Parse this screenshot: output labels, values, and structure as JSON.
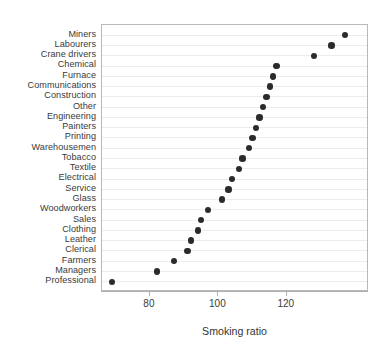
{
  "chart_data": {
    "type": "scatter",
    "plot_style": "cleveland-dot-plot",
    "title": "",
    "xlabel": "Smoking ratio",
    "ylabel": "",
    "xlim": [
      66,
      144
    ],
    "xticks": [
      80,
      100,
      120
    ],
    "xtick_labels": [
      "80",
      "100",
      "120"
    ],
    "grid": true,
    "grid_orientation": "horizontal",
    "legend": "none",
    "marker": "filled-circle",
    "marker_color": "#2b2b2b",
    "categories": [
      "Miners",
      "Labourers",
      "Crane drivers",
      "Chemical",
      "Furnace",
      "Communications",
      "Construction",
      "Other",
      "Engineering",
      "Painters",
      "Printing",
      "Warehousemen",
      "Tobacco",
      "Textile",
      "Electrical",
      "Service",
      "Glass",
      "Woodworkers",
      "Sales",
      "Clothing",
      "Leather",
      "Clerical",
      "Farmers",
      "Managers",
      "Professional"
    ],
    "values": [
      137,
      133,
      128,
      117,
      116,
      115,
      114,
      113,
      112,
      111,
      110,
      109,
      107,
      106,
      104,
      103,
      101,
      97,
      95,
      94,
      92,
      91,
      87,
      82,
      69
    ]
  },
  "axis": {
    "x_title": "Smoking ratio"
  }
}
